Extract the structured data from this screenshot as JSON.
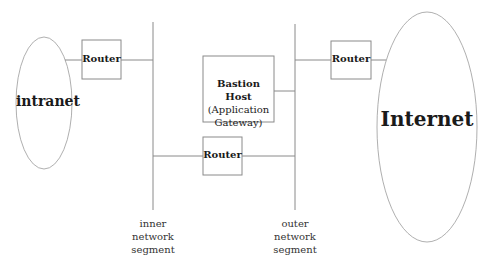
{
  "diagram": {
    "nodes": {
      "intranet": {
        "label": "intranet"
      },
      "internet": {
        "label": "Internet"
      },
      "router_inner": {
        "label": "Router"
      },
      "router_outer": {
        "label": "Router"
      },
      "router_middle": {
        "label": "Router"
      },
      "bastion": {
        "title": "Bastion Host",
        "line2": "(Application",
        "line3": "Gateway)"
      }
    },
    "segments": {
      "inner": {
        "line1": "inner",
        "line2": "network",
        "line3": "segment"
      },
      "outer": {
        "line1": "outer",
        "line2": "network",
        "line3": "segment"
      }
    },
    "colors": {
      "line": "#8a8a8a",
      "text": "#1a1a1a",
      "background": "#ffffff"
    }
  }
}
